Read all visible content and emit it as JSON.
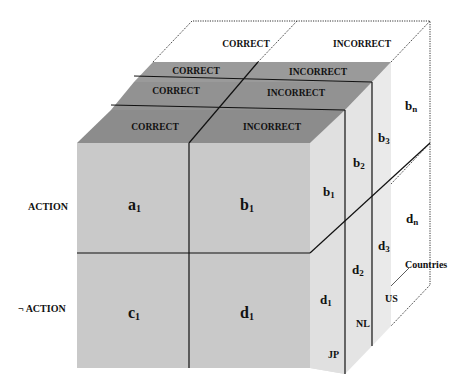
{
  "top": {
    "back_layer": {
      "correct": "CORRECT",
      "incorrect": "INCORRECT"
    },
    "layer_3": {
      "correct": "CORRECT",
      "incorrect": "INCORRECT"
    },
    "layer_2": {
      "correct": "CORRECT",
      "incorrect": "INCORRECT"
    },
    "layer_1": {
      "correct": "CORRECT",
      "incorrect": "INCORRECT"
    }
  },
  "rows": {
    "action": "ACTION",
    "not_action": "¬ ACTION"
  },
  "front": {
    "a": "a",
    "a_sub": "1",
    "b": "b",
    "b_sub": "1",
    "c": "c",
    "c_sub": "1",
    "d": "d",
    "d_sub": "1"
  },
  "side": {
    "b1": "b",
    "b1_sub": "1",
    "b2": "b",
    "b2_sub": "2",
    "b3": "b",
    "b3_sub": "3",
    "bn": "b",
    "bn_sub": "n",
    "d1": "d",
    "d1_sub": "1",
    "d2": "d",
    "d2_sub": "2",
    "d3": "d",
    "d3_sub": "3",
    "dn": "d",
    "dn_sub": "n"
  },
  "countries": {
    "axis_label": "Countries",
    "jp": "JP",
    "nl": "NL",
    "us": "US"
  },
  "colors": {
    "front": "#c8c8c8",
    "top_dark": "#8e8e8e",
    "side": "#e2e2e2",
    "line": "#111111"
  }
}
